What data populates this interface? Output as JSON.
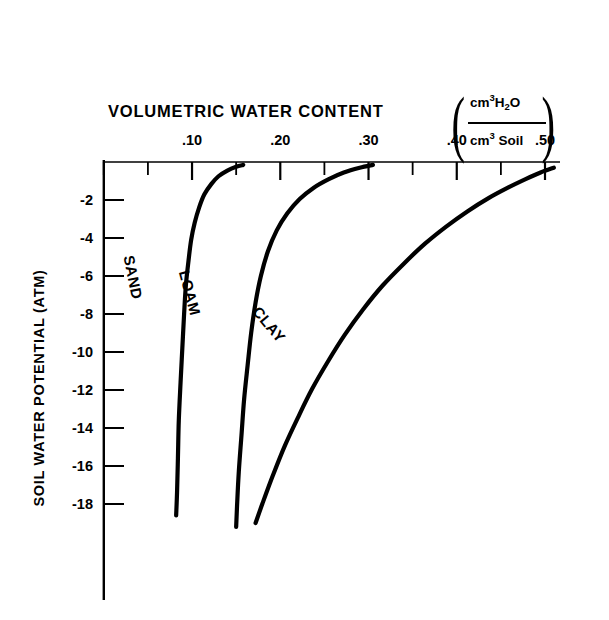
{
  "chart_data": {
    "type": "line",
    "title": "VOLUMETRIC WATER CONTENT",
    "title_units_numerator": "cm3H2O",
    "title_units_denominator": "cm3 Soil",
    "xlabel": "VOLUMETRIC WATER CONTENT (cm3H2O / cm3 Soil)",
    "ylabel": "SOIL WATER POTENTIAL (ATM)",
    "xlim": [
      0.0,
      0.52
    ],
    "ylim": [
      -19.5,
      0.0
    ],
    "xticks": [
      0.0,
      0.05,
      0.1,
      0.15,
      0.2,
      0.25,
      0.3,
      0.35,
      0.4,
      0.45,
      0.5
    ],
    "xtick_labels": [
      ".10",
      ".20",
      ".30",
      ".40",
      ".50"
    ],
    "xtick_label_values": [
      0.1,
      0.2,
      0.3,
      0.4,
      0.5
    ],
    "yticks": [
      -2,
      -4,
      -6,
      -8,
      -10,
      -12,
      -14,
      -16,
      -18
    ],
    "ytick_labels": [
      "-2",
      "-4",
      "-6",
      "-8",
      "-10",
      "-12",
      "-14",
      "-16",
      "-18"
    ],
    "grid": false,
    "legend": "inline curve labels",
    "axis_position": "x-axis on top, y-axis on left",
    "line_color": "#000000",
    "series": [
      {
        "name": "SAND",
        "label": "SAND",
        "points": [
          [
            0.158,
            -0.15
          ],
          [
            0.15,
            -0.25
          ],
          [
            0.14,
            -0.45
          ],
          [
            0.13,
            -0.75
          ],
          [
            0.122,
            -1.15
          ],
          [
            0.114,
            -1.7
          ],
          [
            0.108,
            -2.4
          ],
          [
            0.103,
            -3.2
          ],
          [
            0.099,
            -4.1
          ],
          [
            0.096,
            -5.2
          ],
          [
            0.093,
            -6.5
          ],
          [
            0.091,
            -8.0
          ],
          [
            0.089,
            -9.8
          ],
          [
            0.087,
            -11.6
          ],
          [
            0.085,
            -13.6
          ],
          [
            0.084,
            -15.6
          ],
          [
            0.083,
            -17.4
          ],
          [
            0.082,
            -18.6
          ]
        ]
      },
      {
        "name": "LOAM",
        "label": "LOAM",
        "points": [
          [
            0.305,
            -0.15
          ],
          [
            0.29,
            -0.3
          ],
          [
            0.272,
            -0.55
          ],
          [
            0.255,
            -0.9
          ],
          [
            0.238,
            -1.35
          ],
          [
            0.222,
            -1.95
          ],
          [
            0.208,
            -2.7
          ],
          [
            0.196,
            -3.6
          ],
          [
            0.186,
            -4.7
          ],
          [
            0.178,
            -6.0
          ],
          [
            0.172,
            -7.4
          ],
          [
            0.167,
            -9.0
          ],
          [
            0.163,
            -10.7
          ],
          [
            0.159,
            -12.5
          ],
          [
            0.156,
            -14.4
          ],
          [
            0.153,
            -16.3
          ],
          [
            0.151,
            -18.1
          ],
          [
            0.15,
            -19.2
          ]
        ]
      },
      {
        "name": "CLAY",
        "label": "CLAY",
        "points": [
          [
            0.51,
            -0.3
          ],
          [
            0.495,
            -0.55
          ],
          [
            0.478,
            -0.9
          ],
          [
            0.458,
            -1.35
          ],
          [
            0.436,
            -1.9
          ],
          [
            0.412,
            -2.6
          ],
          [
            0.388,
            -3.4
          ],
          [
            0.364,
            -4.3
          ],
          [
            0.34,
            -5.35
          ],
          [
            0.316,
            -6.5
          ],
          [
            0.294,
            -7.75
          ],
          [
            0.273,
            -9.1
          ],
          [
            0.254,
            -10.5
          ],
          [
            0.236,
            -11.95
          ],
          [
            0.22,
            -13.45
          ],
          [
            0.205,
            -14.95
          ],
          [
            0.192,
            -16.45
          ],
          [
            0.18,
            -17.95
          ],
          [
            0.172,
            -19.0
          ]
        ]
      }
    ]
  },
  "axis": {
    "x_origin_value": 0.0,
    "y_origin_value": 0.0
  }
}
